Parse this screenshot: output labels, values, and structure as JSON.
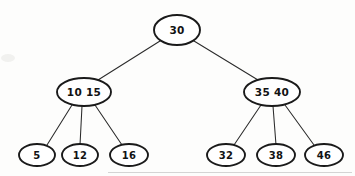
{
  "figure": {
    "title": "",
    "background_color": "#fdfdfc",
    "ink_color": "#1a1a1a"
  },
  "chart_data": {
    "type": "diagram",
    "diagram_kind": "2-3-tree",
    "title": "",
    "nodes": [
      {
        "id": "root",
        "level": 0,
        "keys": "30",
        "keys_list": [
          "30"
        ],
        "cx": 177,
        "cy": 30,
        "rx": 23,
        "ry": 15
      },
      {
        "id": "internal-left",
        "level": 1,
        "keys": "10   15",
        "keys_list": [
          "10",
          "15"
        ],
        "cx": 84,
        "cy": 92,
        "rx": 27,
        "ry": 14
      },
      {
        "id": "internal-right",
        "level": 1,
        "keys": "35   40",
        "keys_list": [
          "35",
          "40"
        ],
        "cx": 272,
        "cy": 92,
        "rx": 28,
        "ry": 14
      },
      {
        "id": "leaf-5",
        "level": 2,
        "keys": "5",
        "keys_list": [
          "5"
        ],
        "cx": 37,
        "cy": 155,
        "rx": 18,
        "ry": 11
      },
      {
        "id": "leaf-12",
        "level": 2,
        "keys": "12",
        "keys_list": [
          "12"
        ],
        "cx": 80,
        "cy": 155,
        "rx": 18,
        "ry": 11
      },
      {
        "id": "leaf-16",
        "level": 2,
        "keys": "16",
        "keys_list": [
          "16"
        ],
        "cx": 129,
        "cy": 155,
        "rx": 19,
        "ry": 11
      },
      {
        "id": "leaf-32",
        "level": 2,
        "keys": "32",
        "keys_list": [
          "32"
        ],
        "cx": 226,
        "cy": 155,
        "rx": 19,
        "ry": 11
      },
      {
        "id": "leaf-38",
        "level": 2,
        "keys": "38",
        "keys_list": [
          "38"
        ],
        "cx": 276,
        "cy": 155,
        "rx": 19,
        "ry": 11
      },
      {
        "id": "leaf-46",
        "level": 2,
        "keys": "46",
        "keys_list": [
          "46"
        ],
        "cx": 324,
        "cy": 155,
        "rx": 19,
        "ry": 11
      }
    ],
    "edges": [
      {
        "id": "edge-root-left",
        "from": "root",
        "to": "internal-left",
        "x1": 160,
        "y1": 41,
        "x2": 98,
        "y2": 80
      },
      {
        "id": "edge-root-right",
        "from": "root",
        "to": "internal-right",
        "x1": 194,
        "y1": 41,
        "x2": 258,
        "y2": 80
      },
      {
        "id": "edge-left-5",
        "from": "internal-left",
        "to": "leaf-5",
        "x1": 72,
        "y1": 105,
        "x2": 47,
        "y2": 145
      },
      {
        "id": "edge-left-12",
        "from": "internal-left",
        "to": "leaf-12",
        "x1": 82,
        "y1": 106,
        "x2": 80,
        "y2": 145
      },
      {
        "id": "edge-left-16",
        "from": "internal-left",
        "to": "leaf-16",
        "x1": 95,
        "y1": 105,
        "x2": 122,
        "y2": 145
      },
      {
        "id": "edge-right-32",
        "from": "internal-right",
        "to": "leaf-32",
        "x1": 261,
        "y1": 105,
        "x2": 234,
        "y2": 145
      },
      {
        "id": "edge-right-38",
        "from": "internal-right",
        "to": "leaf-38",
        "x1": 273,
        "y1": 106,
        "x2": 276,
        "y2": 145
      },
      {
        "id": "edge-right-46",
        "from": "internal-right",
        "to": "leaf-46",
        "x1": 285,
        "y1": 105,
        "x2": 314,
        "y2": 145
      }
    ]
  }
}
